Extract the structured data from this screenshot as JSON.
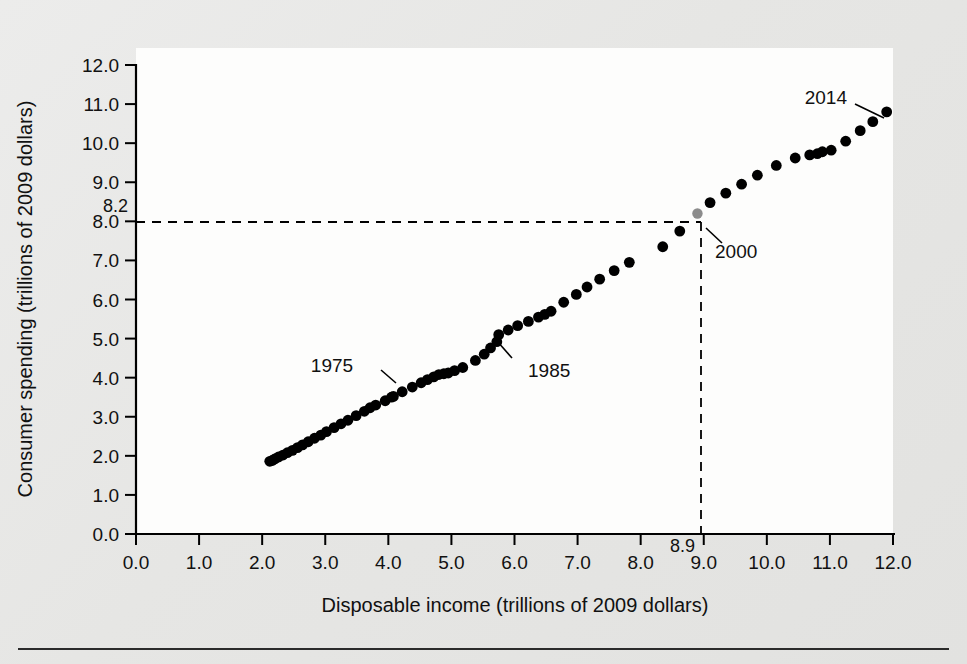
{
  "figure": {
    "title": "",
    "background_color": "#e9e9e7",
    "plot_background_color": "#fdfdfc"
  },
  "chart_data": {
    "type": "scatter",
    "title": "",
    "xlabel": "Disposable income (trillions of 2009 dollars)",
    "ylabel": "Consumer spending (trillions of 2009 dollars)",
    "xlim": [
      0.0,
      12.0
    ],
    "ylim": [
      0.0,
      12.0
    ],
    "xticks": [
      "0.0",
      "1.0",
      "2.0",
      "3.0",
      "4.0",
      "5.0",
      "6.0",
      "7.0",
      "8.0",
      "9.0",
      "10.0",
      "11.0",
      "12.0"
    ],
    "yticks": [
      "0.0",
      "1.0",
      "2.0",
      "3.0",
      "4.0",
      "5.0",
      "6.0",
      "7.0",
      "8.0",
      "9.0",
      "10.0",
      "11.0",
      "12.0"
    ],
    "grid": false,
    "legend": null,
    "marker_color": "#000000",
    "highlight_marker_color": "#8c8c8c",
    "reference_lines": {
      "x_value": 8.9,
      "y_value": 8.2,
      "x_label": "8.9",
      "y_label": "8.2",
      "style": "dashed",
      "intersection_point_label": "2000"
    },
    "annotations": [
      {
        "label": "1975",
        "x": 4.05,
        "y": 3.5
      },
      {
        "label": "1985",
        "x": 5.75,
        "y": 5.1
      },
      {
        "label": "2000",
        "x": 8.9,
        "y": 8.2
      },
      {
        "label": "2014",
        "x": 11.9,
        "y": 10.8
      }
    ],
    "series": [
      {
        "name": "Consumer spending vs disposable income",
        "points": [
          [
            2.12,
            1.86
          ],
          [
            2.16,
            1.88
          ],
          [
            2.2,
            1.92
          ],
          [
            2.26,
            1.97
          ],
          [
            2.33,
            2.02
          ],
          [
            2.4,
            2.08
          ],
          [
            2.48,
            2.14
          ],
          [
            2.56,
            2.21
          ],
          [
            2.64,
            2.28
          ],
          [
            2.73,
            2.36
          ],
          [
            2.83,
            2.45
          ],
          [
            2.93,
            2.53
          ],
          [
            3.02,
            2.62
          ],
          [
            3.14,
            2.72
          ],
          [
            3.25,
            2.82
          ],
          [
            3.36,
            2.91
          ],
          [
            3.49,
            3.03
          ],
          [
            3.62,
            3.14
          ],
          [
            3.71,
            3.23
          ],
          [
            3.8,
            3.3
          ],
          [
            3.95,
            3.41
          ],
          [
            4.05,
            3.5
          ],
          [
            4.08,
            3.52
          ],
          [
            4.22,
            3.64
          ],
          [
            4.38,
            3.76
          ],
          [
            4.52,
            3.87
          ],
          [
            4.62,
            3.95
          ],
          [
            4.72,
            4.02
          ],
          [
            4.8,
            4.08
          ],
          [
            4.88,
            4.1
          ],
          [
            4.95,
            4.12
          ],
          [
            5.05,
            4.18
          ],
          [
            5.18,
            4.26
          ],
          [
            5.38,
            4.44
          ],
          [
            5.52,
            4.6
          ],
          [
            5.62,
            4.76
          ],
          [
            5.72,
            4.92
          ],
          [
            5.75,
            5.1
          ],
          [
            5.9,
            5.22
          ],
          [
            6.05,
            5.33
          ],
          [
            6.22,
            5.44
          ],
          [
            6.38,
            5.55
          ],
          [
            6.48,
            5.62
          ],
          [
            6.58,
            5.7
          ],
          [
            6.78,
            5.93
          ],
          [
            6.98,
            6.13
          ],
          [
            7.15,
            6.32
          ],
          [
            7.35,
            6.52
          ],
          [
            7.58,
            6.74
          ],
          [
            7.82,
            6.95
          ],
          [
            8.35,
            7.35
          ],
          [
            8.62,
            7.75
          ],
          [
            8.9,
            8.2
          ],
          [
            9.1,
            8.48
          ],
          [
            9.35,
            8.72
          ],
          [
            9.6,
            8.95
          ],
          [
            9.85,
            9.18
          ],
          [
            10.15,
            9.43
          ],
          [
            10.45,
            9.62
          ],
          [
            10.68,
            9.7
          ],
          [
            10.8,
            9.73
          ],
          [
            10.88,
            9.78
          ],
          [
            11.02,
            9.82
          ],
          [
            11.25,
            10.05
          ],
          [
            11.48,
            10.32
          ],
          [
            11.68,
            10.55
          ],
          [
            11.9,
            10.8
          ]
        ]
      }
    ]
  }
}
